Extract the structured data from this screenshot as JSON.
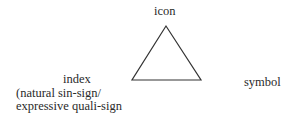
{
  "diagram": {
    "shape": "triangle",
    "line_color": "#333333",
    "vertices": {
      "top": {
        "label": "icon"
      },
      "left": {
        "label": "index",
        "note_lines": [
          "(natural sin-sign/",
          "expressive quali-sign"
        ]
      },
      "right": {
        "label": "symbol"
      }
    }
  }
}
